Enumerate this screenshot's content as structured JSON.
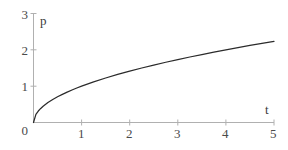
{
  "chart_data": {
    "type": "line",
    "title": "",
    "subtitle": "",
    "xlabel": "t",
    "ylabel": "p",
    "function": "p = sqrt(t)",
    "xlim": [
      0,
      5
    ],
    "ylim": [
      0,
      3
    ],
    "grid": false,
    "legend": null,
    "x_ticks": [
      0,
      1,
      2,
      3,
      4,
      5
    ],
    "x_tick_labels": [
      "0",
      "1",
      "2",
      "3",
      "4",
      "5"
    ],
    "y_ticks": [
      0,
      1,
      2,
      3
    ],
    "y_tick_labels": [
      "0",
      "1",
      "2",
      "3"
    ],
    "series": [
      {
        "name": "p = sqrt(t)",
        "color": "#2b2b2b",
        "x": [
          0,
          0.05,
          0.1,
          0.15,
          0.2,
          0.3,
          0.4,
          0.5,
          0.6,
          0.7,
          0.8,
          0.9,
          1,
          1.25,
          1.5,
          1.75,
          2,
          2.25,
          2.5,
          2.75,
          3,
          3.25,
          3.5,
          3.75,
          4,
          4.25,
          4.5,
          4.75,
          5
        ],
        "y": [
          0,
          0.224,
          0.316,
          0.387,
          0.447,
          0.548,
          0.632,
          0.707,
          0.775,
          0.837,
          0.894,
          0.949,
          1,
          1.118,
          1.225,
          1.323,
          1.414,
          1.5,
          1.581,
          1.658,
          1.732,
          1.803,
          1.871,
          1.936,
          2,
          2.062,
          2.121,
          2.179,
          2.236
        ]
      }
    ],
    "colors": {
      "curve": "#2b2b2b",
      "axis": "#b0b0b0",
      "tick_text": "#4a4a4a",
      "background": "#ffffff"
    }
  },
  "axis_labels": {
    "y_name": "p",
    "x_name": "t"
  },
  "ticks": {
    "y": [
      {
        "label": "3"
      },
      {
        "label": "2"
      },
      {
        "label": "1"
      },
      {
        "label": "0"
      }
    ],
    "x": [
      {
        "label": "1"
      },
      {
        "label": "2"
      },
      {
        "label": "3"
      },
      {
        "label": "4"
      },
      {
        "label": "5"
      }
    ]
  }
}
